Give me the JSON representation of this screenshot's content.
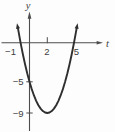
{
  "figure": {
    "background": "#fdfdfd",
    "axis_color": "#4d4d4d",
    "curve_color": "#2f2f2f",
    "label_color": "#3e3e3e"
  },
  "chart_data": {
    "type": "line",
    "title": "",
    "xlabel": "t",
    "ylabel": "y",
    "xlim": [
      -1.5,
      6
    ],
    "ylim": [
      -10.5,
      3.5
    ],
    "grid": false,
    "legend": false,
    "x_ticks": [
      {
        "value": -1,
        "label": "−1"
      },
      {
        "value": 2,
        "label": "2"
      },
      {
        "value": 5,
        "label": "5"
      }
    ],
    "y_ticks": [
      {
        "value": -5,
        "label": "−5"
      },
      {
        "value": -9,
        "label": "−9"
      }
    ],
    "key_points": {
      "x_intercepts": [
        -1,
        5
      ],
      "y_intercept": -5,
      "vertex": [
        2,
        -9
      ]
    },
    "series": [
      {
        "name": "parabola",
        "x": [
          -1.3,
          -1.25,
          -1,
          -0.75,
          -0.5,
          -0.25,
          0,
          0.25,
          0.5,
          0.75,
          1,
          1.25,
          1.5,
          1.75,
          2,
          2.25,
          2.5,
          2.75,
          3,
          3.25,
          3.5,
          3.75,
          4,
          4.25,
          4.5,
          4.75,
          5,
          5.25,
          5.3
        ],
        "y": [
          1.89,
          1.56,
          0,
          -1.44,
          -2.75,
          -3.94,
          -5,
          -5.94,
          -6.75,
          -7.44,
          -8,
          -8.44,
          -8.75,
          -8.94,
          -9,
          -8.94,
          -8.75,
          -8.44,
          -8,
          -7.44,
          -6.75,
          -5.94,
          -5,
          -3.94,
          -2.75,
          -1.44,
          0,
          1.56,
          1.89
        ]
      }
    ]
  }
}
